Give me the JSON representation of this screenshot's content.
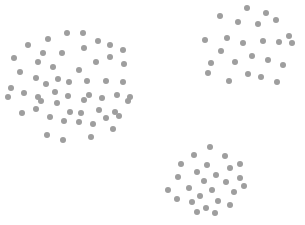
{
  "canvas": {
    "width": 305,
    "height": 225,
    "background_color": "#ffffff"
  },
  "chart_data": {
    "type": "scatter",
    "title": "",
    "subtitle": "",
    "xlabel": "",
    "ylabel": "",
    "xlim": [
      0,
      305
    ],
    "ylim": [
      0,
      225
    ],
    "grid": false,
    "axes_visible": false,
    "tick_labels_x": [],
    "tick_labels_y": [],
    "legend": null,
    "legend_position": "none",
    "annotations": [],
    "marker": {
      "shape": "circle",
      "diameter_px": 6,
      "color": "#9e9e9e",
      "opacity": 1
    },
    "series": [
      {
        "name": "cluster-1",
        "color": "#9e9e9e",
        "count": 55,
        "centroid": [
          72,
          82
        ],
        "points": [
          [
            67,
            33
          ],
          [
            83,
            33
          ],
          [
            48,
            39
          ],
          [
            98,
            41
          ],
          [
            110,
            45
          ],
          [
            28,
            45
          ],
          [
            43,
            53
          ],
          [
            62,
            53
          ],
          [
            84,
            48
          ],
          [
            110,
            57
          ],
          [
            123,
            50
          ],
          [
            14,
            58
          ],
          [
            38,
            62
          ],
          [
            53,
            67
          ],
          [
            79,
            70
          ],
          [
            96,
            62
          ],
          [
            124,
            64
          ],
          [
            36,
            78
          ],
          [
            58,
            79
          ],
          [
            11,
            88
          ],
          [
            46,
            84
          ],
          [
            69,
            82
          ],
          [
            87,
            81
          ],
          [
            106,
            81
          ],
          [
            123,
            82
          ],
          [
            24,
            93
          ],
          [
            38,
            97
          ],
          [
            55,
            92
          ],
          [
            68,
            96
          ],
          [
            89,
            95
          ],
          [
            102,
            98
          ],
          [
            117,
            95
          ],
          [
            130,
            97
          ],
          [
            22,
            113
          ],
          [
            36,
            109
          ],
          [
            41,
            101
          ],
          [
            57,
            103
          ],
          [
            70,
            112
          ],
          [
            84,
            100
          ],
          [
            81,
            113
          ],
          [
            99,
            110
          ],
          [
            115,
            112
          ],
          [
            128,
            101
          ],
          [
            50,
            117
          ],
          [
            64,
            121
          ],
          [
            79,
            122
          ],
          [
            93,
            124
          ],
          [
            106,
            118
          ],
          [
            119,
            116
          ],
          [
            47,
            135
          ],
          [
            63,
            140
          ],
          [
            91,
            137
          ],
          [
            113,
            129
          ],
          [
            20,
            72
          ],
          [
            8,
            97
          ]
        ]
      },
      {
        "name": "cluster-2",
        "color": "#9e9e9e",
        "count": 24,
        "centroid": [
          248,
          48
        ],
        "points": [
          [
            247,
            8
          ],
          [
            220,
            16
          ],
          [
            266,
            13
          ],
          [
            238,
            22
          ],
          [
            276,
            20
          ],
          [
            258,
            24
          ],
          [
            205,
            40
          ],
          [
            227,
            38
          ],
          [
            243,
            43
          ],
          [
            263,
            41
          ],
          [
            279,
            42
          ],
          [
            292,
            43
          ],
          [
            221,
            51
          ],
          [
            252,
            56
          ],
          [
            235,
            62
          ],
          [
            211,
            63
          ],
          [
            268,
            60
          ],
          [
            283,
            65
          ],
          [
            248,
            74
          ],
          [
            261,
            77
          ],
          [
            229,
            81
          ],
          [
            208,
            73
          ],
          [
            277,
            82
          ],
          [
            289,
            36
          ]
        ]
      },
      {
        "name": "cluster-3",
        "color": "#9e9e9e",
        "count": 26,
        "centroid": [
          212,
          184
        ],
        "points": [
          [
            210,
            147
          ],
          [
            194,
            155
          ],
          [
            225,
            156
          ],
          [
            181,
            164
          ],
          [
            207,
            165
          ],
          [
            230,
            168
          ],
          [
            240,
            164
          ],
          [
            197,
            172
          ],
          [
            216,
            175
          ],
          [
            178,
            177
          ],
          [
            204,
            181
          ],
          [
            226,
            182
          ],
          [
            240,
            178
          ],
          [
            189,
            188
          ],
          [
            212,
            190
          ],
          [
            200,
            196
          ],
          [
            234,
            192
          ],
          [
            177,
            199
          ],
          [
            192,
            202
          ],
          [
            218,
            201
          ],
          [
            206,
            208
          ],
          [
            230,
            205
          ],
          [
            197,
            212
          ],
          [
            215,
            213
          ],
          [
            168,
            190
          ],
          [
            244,
            186
          ]
        ]
      }
    ]
  }
}
